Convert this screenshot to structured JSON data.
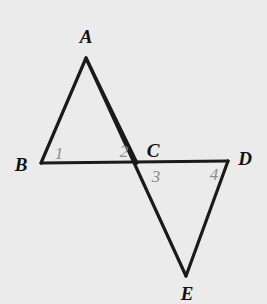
{
  "figure": {
    "background_color": "#ebebeb",
    "stroke_color": "#1a1a1a",
    "stroke_width": 3.2,
    "vertex_label_color": "#111111",
    "angle_label_color": "#8d8d8d",
    "width": 267,
    "height": 304
  },
  "chart_data": {
    "type": "diagram",
    "points": [
      {
        "name": "A",
        "x": 86,
        "y": 58
      },
      {
        "name": "B",
        "x": 41,
        "y": 163
      },
      {
        "name": "C",
        "x": 137,
        "y": 163
      },
      {
        "name": "D",
        "x": 228,
        "y": 161
      },
      {
        "name": "E",
        "x": 186,
        "y": 276
      }
    ],
    "segments": [
      {
        "name": "AB",
        "from": "A",
        "to": "B"
      },
      {
        "name": "BD",
        "from": "B",
        "to": "D"
      },
      {
        "name": "AE",
        "from": "A",
        "to": "E"
      },
      {
        "name": "DE",
        "from": "D",
        "to": "E"
      }
    ],
    "polylines": [
      {
        "name": "triangle-ABC-path",
        "d": "M 41 163 L 86 58 L 137 163"
      },
      {
        "name": "transversal-A-to-E",
        "d": "M 86 58 L 186 276"
      },
      {
        "name": "baseline-B-to-D",
        "d": "M 41 163 L 228 161"
      },
      {
        "name": "segment-D-to-E",
        "d": "M 228 161 L 186 276"
      }
    ],
    "angle_marks": [
      "1",
      "2",
      "3",
      "4"
    ]
  },
  "vertices": [
    {
      "id": "A",
      "label": "A",
      "x": 86,
      "y": 36
    },
    {
      "id": "B",
      "label": "B",
      "x": 21,
      "y": 164
    },
    {
      "id": "C",
      "label": "C",
      "x": 153,
      "y": 150
    },
    {
      "id": "D",
      "label": "D",
      "x": 245,
      "y": 158
    },
    {
      "id": "E",
      "label": "E",
      "x": 187,
      "y": 293
    }
  ],
  "angles": [
    {
      "id": "1",
      "label": "1",
      "x": 59,
      "y": 153,
      "at_vertex": "B"
    },
    {
      "id": "2",
      "label": "2",
      "x": 124,
      "y": 151,
      "at_vertex": "C"
    },
    {
      "id": "3",
      "label": "3",
      "x": 156,
      "y": 176,
      "at_vertex": "C"
    },
    {
      "id": "4",
      "label": "4",
      "x": 214,
      "y": 174,
      "at_vertex": "D"
    }
  ]
}
